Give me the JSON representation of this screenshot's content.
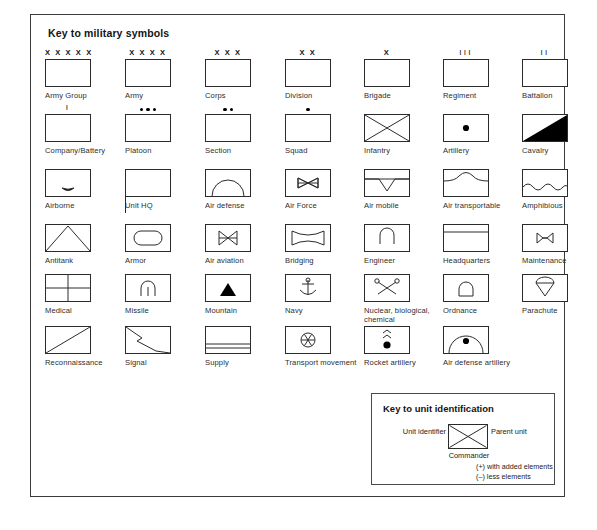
{
  "plate": {
    "title": "Key to military symbols"
  },
  "symbols": [
    {
      "label": "Army Group",
      "glyph": "plain",
      "top": "X X X X X",
      "col": 0,
      "row": 0
    },
    {
      "label": "Army",
      "glyph": "plain",
      "top": "X X X X",
      "col": 1,
      "row": 0
    },
    {
      "label": "Corps",
      "glyph": "plain",
      "top": "X X X",
      "col": 2,
      "row": 0
    },
    {
      "label": "Division",
      "glyph": "plain",
      "top": "X X",
      "col": 3,
      "row": 0
    },
    {
      "label": "Brigade",
      "glyph": "plain",
      "top": "X",
      "col": 4,
      "row": 0
    },
    {
      "label": "Regiment",
      "glyph": "plain",
      "top": "III",
      "col": 5,
      "row": 0
    },
    {
      "label": "Battalion",
      "glyph": "plain",
      "top": "II",
      "col": 6,
      "row": 0
    },
    {
      "label": "Company/Battery",
      "glyph": "plain",
      "top": "I",
      "col": 0,
      "row": 1
    },
    {
      "label": "Platoon",
      "glyph": "plain",
      "dots": 3,
      "col": 1,
      "row": 1
    },
    {
      "label": "Section",
      "glyph": "plain",
      "dots": 2,
      "col": 2,
      "row": 1
    },
    {
      "label": "Squad",
      "glyph": "plain",
      "dots": 1,
      "col": 3,
      "row": 1
    },
    {
      "label": "Infantry",
      "glyph": "infantry",
      "col": 4,
      "row": 1
    },
    {
      "label": "Artillery",
      "glyph": "artillery",
      "col": 5,
      "row": 1
    },
    {
      "label": "Cavalry",
      "glyph": "cavalry",
      "col": 6,
      "row": 1
    },
    {
      "label": "Airborne",
      "glyph": "airborne",
      "col": 0,
      "row": 2
    },
    {
      "label": "Unit HQ",
      "glyph": "unit-hq",
      "col": 1,
      "row": 2
    },
    {
      "label": "Air defense",
      "glyph": "air-defense",
      "col": 2,
      "row": 2
    },
    {
      "label": "Air Force",
      "glyph": "air-force",
      "col": 3,
      "row": 2
    },
    {
      "label": "Air mobile",
      "glyph": "air-mobile",
      "col": 4,
      "row": 2
    },
    {
      "label": "Air transportable",
      "glyph": "air-transportable",
      "col": 5,
      "row": 2
    },
    {
      "label": "Amphibious",
      "glyph": "amphibious",
      "col": 6,
      "row": 2
    },
    {
      "label": "Antitank",
      "glyph": "antitank",
      "col": 0,
      "row": 3
    },
    {
      "label": "Armor",
      "glyph": "armor",
      "col": 1,
      "row": 3
    },
    {
      "label": "Air aviation",
      "glyph": "air-aviation",
      "col": 2,
      "row": 3
    },
    {
      "label": "Bridging",
      "glyph": "bridging",
      "col": 3,
      "row": 3
    },
    {
      "label": "Engineer",
      "glyph": "engineer",
      "col": 4,
      "row": 3
    },
    {
      "label": "Headquarters",
      "glyph": "headquarters",
      "col": 5,
      "row": 3
    },
    {
      "label": "Maintenance",
      "glyph": "maintenance",
      "col": 6,
      "row": 3
    },
    {
      "label": "Medical",
      "glyph": "medical",
      "col": 0,
      "row": 4
    },
    {
      "label": "Missile",
      "glyph": "missile",
      "col": 1,
      "row": 4
    },
    {
      "label": "Mountain",
      "glyph": "mountain",
      "col": 2,
      "row": 4
    },
    {
      "label": "Navy",
      "glyph": "navy",
      "col": 3,
      "row": 4
    },
    {
      "label": "Nuclear, biological, chemical",
      "glyph": "nbc",
      "col": 4,
      "row": 4
    },
    {
      "label": "Ordnance",
      "glyph": "ordnance",
      "col": 5,
      "row": 4
    },
    {
      "label": "Parachute",
      "glyph": "parachute",
      "col": 6,
      "row": 4
    },
    {
      "label": "Reconnaissance",
      "glyph": "reconnaissance",
      "col": 0,
      "row": 5
    },
    {
      "label": "Signal",
      "glyph": "signal",
      "col": 1,
      "row": 5
    },
    {
      "label": "Supply",
      "glyph": "supply",
      "col": 2,
      "row": 5
    },
    {
      "label": "Transport movement",
      "glyph": "transport",
      "col": 3,
      "row": 5
    },
    {
      "label": "Rocket artillery",
      "glyph": "rocket-artillery",
      "col": 4,
      "row": 5
    },
    {
      "label": "Air defense artillery",
      "glyph": "air-defense-artillery",
      "col": 5,
      "row": 5
    }
  ],
  "unit_key": {
    "title": "Key to unit identification",
    "unit_identifier": "Unit identifier",
    "parent_unit": "Parent unit",
    "commander": "Commander",
    "note_plus": "(+) with added elements",
    "note_minus": "(–) less elements"
  },
  "colors": {
    "ink": "#1b1b1b",
    "frame": "#3a3a3a",
    "label": "#2d2d2d",
    "fill": "#000000",
    "paper": "#ffffff"
  }
}
